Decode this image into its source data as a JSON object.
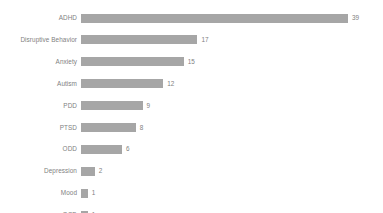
{
  "chart_data": {
    "type": "bar",
    "orientation": "horizontal",
    "title": "",
    "subtitle": "",
    "xlabel": "",
    "ylabel": "",
    "grid": false,
    "legend": false,
    "axis_visible": false,
    "tick_labels_x": [],
    "xlim": [
      0,
      39
    ],
    "categories": [
      "ADHD",
      "Disruptive Behavior",
      "Anxiety",
      "Autism",
      "PDD",
      "PTSD",
      "ODD",
      "Depression",
      "Mood",
      "OCD"
    ],
    "values": [
      39,
      17,
      15,
      12,
      9,
      8,
      6,
      2,
      1,
      1
    ],
    "data_labels": [
      "39",
      "17",
      "15",
      "12",
      "9",
      "8",
      "6",
      "2",
      "1",
      "1"
    ],
    "bar_color": "#a6a6a6",
    "label_color": "#7f7f7f",
    "background_color": "#ffffff"
  }
}
